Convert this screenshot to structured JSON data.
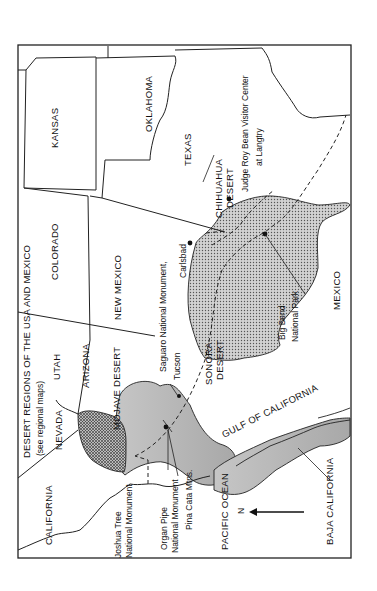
{
  "map": {
    "title": "DESERT REGIONS OF THE USA AND MEXICO",
    "subtitle": "(see regional maps)",
    "orientation": "rotated 90° counter-clockwise",
    "north_arrow_label": "N",
    "states": {
      "kansas": "KANSAS",
      "oklahoma": "OKLAHOMA",
      "texas": "TEXAS",
      "colorado": "COLORADO",
      "new_mexico": "NEW MEXICO",
      "utah": "UTAH",
      "arizona": "ARIZONA",
      "nevada": "NEVADA",
      "california": "CALIFORNIA"
    },
    "countries": {
      "mexico": "MEXICO"
    },
    "water": {
      "pacific": "PACIFIC OCEAN",
      "gulf": "GULF OF CALIFORNIA"
    },
    "regions": {
      "baja": "BAJA CALIFORNIA"
    },
    "deserts": {
      "mojave": "MOJAVE DESERT",
      "sonora_1": "SONORA",
      "sonora_2": "DESERT",
      "chihuahua_1": "CHIHUAHUA",
      "chihuahua_2": "DESERT"
    },
    "landmarks": {
      "saguaro": "Saguaro National Monument,",
      "tucson": "Tucson",
      "carlsbad": "Carlsbad",
      "judge_1": "Judge Roy Bean Visitor Center",
      "judge_2": "at Langtry",
      "bigbend_1": "Big Bend",
      "bigbend_2": "National Park",
      "joshua_1": "Joshua Tree",
      "joshua_2": "National Monument",
      "organ_1": "Organ Pipe",
      "organ_2": "National Monument",
      "pina": "Pina Cata Mtns."
    },
    "colors": {
      "ink": "#111111",
      "desert_fill": "#c8c8c8",
      "mojave_fill": "#9a9a9a",
      "paper": "#ffffff"
    }
  }
}
